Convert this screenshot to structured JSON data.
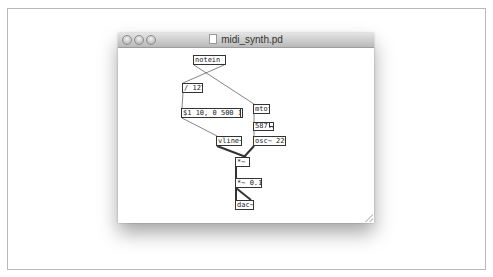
{
  "window": {
    "title": "midi_synth.pd",
    "buttons": [
      "close",
      "minimize",
      "zoom"
    ]
  },
  "patch": {
    "objects": [
      {
        "id": "notein",
        "type": "object",
        "text": "notein 1"
      },
      {
        "id": "div127",
        "type": "object",
        "text": "/ 127"
      },
      {
        "id": "envmsg",
        "type": "message",
        "text": "$1 10, 0 500 10"
      },
      {
        "id": "mtof",
        "type": "object",
        "text": "mtof"
      },
      {
        "id": "freqnum",
        "type": "number",
        "text": "587.3"
      },
      {
        "id": "vline",
        "type": "object",
        "text": "vline~"
      },
      {
        "id": "osc",
        "type": "object",
        "text": "osc~ 220"
      },
      {
        "id": "mul",
        "type": "object",
        "text": "*~"
      },
      {
        "id": "mul01",
        "type": "object",
        "text": "*~ 0.1"
      },
      {
        "id": "dac",
        "type": "object",
        "text": "dac~"
      }
    ],
    "connections": [
      [
        "notein",
        "mtof",
        "control"
      ],
      [
        "notein",
        "div127",
        "control"
      ],
      [
        "div127",
        "envmsg",
        "control"
      ],
      [
        "envmsg",
        "vline",
        "control"
      ],
      [
        "mtof",
        "freqnum",
        "control"
      ],
      [
        "freqnum",
        "osc",
        "control"
      ],
      [
        "vline",
        "mul",
        "signal"
      ],
      [
        "osc",
        "mul",
        "signal"
      ],
      [
        "mul",
        "mul01",
        "signal"
      ],
      [
        "mul01",
        "dac",
        "signal"
      ]
    ]
  },
  "colors": {
    "wire": "#555555",
    "signal_wire": "#333333",
    "box_border": "#333333"
  }
}
